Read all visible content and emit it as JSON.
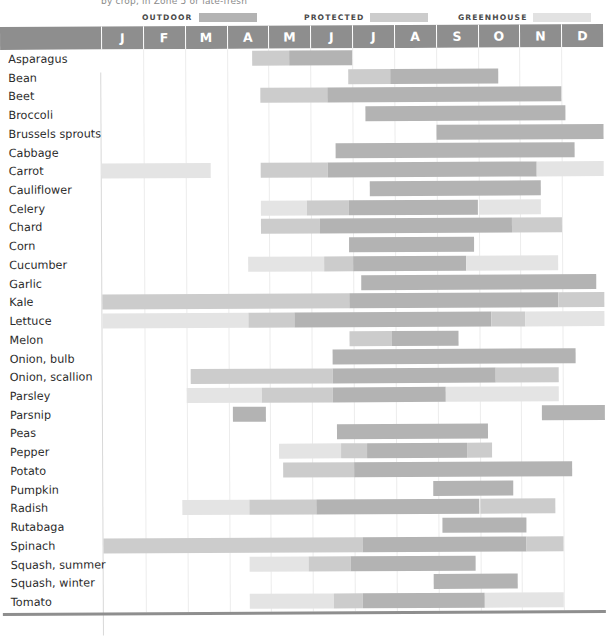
{
  "caption": "by crop, in Zone 5 or late-fresh",
  "legend": {
    "items": [
      {
        "label": "OUTDOOR",
        "color": "#b3b3b3",
        "key": "outdoor"
      },
      {
        "label": "PROTECTED",
        "color": "#cccccc",
        "key": "protected"
      },
      {
        "label": "GREENHOUSE",
        "color": "#e2e2e2",
        "key": "greenhouse"
      }
    ]
  },
  "colors": {
    "outdoor": "#b3b3b3",
    "protected": "#cccccc",
    "greenhouse": "#e4e4e4",
    "header_band": "#8e8e8e",
    "gridline": "#ececec",
    "text": "#2b2b2b"
  },
  "months": [
    "J",
    "F",
    "M",
    "A",
    "M",
    "J",
    "J",
    "A",
    "S",
    "O",
    "N",
    "D"
  ],
  "chart_data": {
    "type": "bar",
    "xlabel": "Month",
    "ylabel": "Crop",
    "grid": true,
    "legend_position": "top",
    "x": [
      "J",
      "F",
      "M",
      "A",
      "M",
      "J",
      "J",
      "A",
      "S",
      "O",
      "N",
      "D"
    ],
    "xlim": [
      0,
      12
    ],
    "categories": [
      "Asparagus",
      "Bean",
      "Beet",
      "Broccoli",
      "Brussels sprouts",
      "Cabbage",
      "Carrot",
      "Cauliflower",
      "Celery",
      "Chard",
      "Corn",
      "Cucumber",
      "Garlic",
      "Kale",
      "Lettuce",
      "Melon",
      "Onion, bulb",
      "Onion, scallion",
      "Parsley",
      "Parsnip",
      "Peas",
      "Pepper",
      "Potato",
      "Pumpkin",
      "Radish",
      "Rutabaga",
      "Spinach",
      "Squash, summer",
      "Squash, winter",
      "Tomato"
    ],
    "series": [
      {
        "name": "outdoor",
        "label": "OUTDOOR",
        "color": "#b3b3b3"
      },
      {
        "name": "protected",
        "label": "PROTECTED",
        "color": "#cccccc"
      },
      {
        "name": "greenhouse",
        "label": "GREENHOUSE",
        "color": "#e4e4e4"
      }
    ],
    "rows": [
      {
        "crop": "Asparagus",
        "bars": [
          {
            "type": "protected",
            "start": 3.6,
            "end": 4.5
          },
          {
            "type": "outdoor",
            "start": 4.5,
            "end": 6.0
          }
        ]
      },
      {
        "crop": "Bean",
        "bars": [
          {
            "type": "protected",
            "start": 5.9,
            "end": 6.9
          },
          {
            "type": "outdoor",
            "start": 6.9,
            "end": 9.5
          }
        ]
      },
      {
        "crop": "Beet",
        "bars": [
          {
            "type": "protected",
            "start": 3.8,
            "end": 5.4
          },
          {
            "type": "outdoor",
            "start": 5.4,
            "end": 11.0
          }
        ]
      },
      {
        "crop": "Broccoli",
        "bars": [
          {
            "type": "outdoor",
            "start": 6.3,
            "end": 11.1
          }
        ]
      },
      {
        "crop": "Brussels sprouts",
        "bars": [
          {
            "type": "outdoor",
            "start": 8.0,
            "end": 12.0
          }
        ]
      },
      {
        "crop": "Cabbage",
        "bars": [
          {
            "type": "outdoor",
            "start": 5.6,
            "end": 11.3
          }
        ]
      },
      {
        "crop": "Carrot",
        "bars": [
          {
            "type": "greenhouse",
            "start": 0.0,
            "end": 2.6
          },
          {
            "type": "protected",
            "start": 3.8,
            "end": 5.4
          },
          {
            "type": "outdoor",
            "start": 5.4,
            "end": 10.4
          },
          {
            "type": "greenhouse",
            "start": 10.4,
            "end": 12.0
          }
        ]
      },
      {
        "crop": "Cauliflower",
        "bars": [
          {
            "type": "outdoor",
            "start": 6.4,
            "end": 10.5
          }
        ]
      },
      {
        "crop": "Celery",
        "bars": [
          {
            "type": "greenhouse",
            "start": 3.8,
            "end": 4.9
          },
          {
            "type": "protected",
            "start": 4.9,
            "end": 5.9
          },
          {
            "type": "outdoor",
            "start": 5.9,
            "end": 9.0
          },
          {
            "type": "greenhouse",
            "start": 9.0,
            "end": 10.5
          }
        ]
      },
      {
        "crop": "Chard",
        "bars": [
          {
            "type": "protected",
            "start": 3.8,
            "end": 5.2
          },
          {
            "type": "outdoor",
            "start": 5.2,
            "end": 9.8
          },
          {
            "type": "protected",
            "start": 9.8,
            "end": 11.0
          }
        ]
      },
      {
        "crop": "Corn",
        "bars": [
          {
            "type": "outdoor",
            "start": 5.9,
            "end": 8.9
          }
        ]
      },
      {
        "crop": "Cucumber",
        "bars": [
          {
            "type": "greenhouse",
            "start": 3.5,
            "end": 5.3
          },
          {
            "type": "protected",
            "start": 5.3,
            "end": 6.0
          },
          {
            "type": "outdoor",
            "start": 6.0,
            "end": 8.7
          },
          {
            "type": "greenhouse",
            "start": 8.7,
            "end": 10.9
          }
        ]
      },
      {
        "crop": "Garlic",
        "bars": [
          {
            "type": "outdoor",
            "start": 6.2,
            "end": 11.8
          }
        ]
      },
      {
        "crop": "Kale",
        "bars": [
          {
            "type": "protected",
            "start": 0.0,
            "end": 5.9
          },
          {
            "type": "outdoor",
            "start": 5.9,
            "end": 10.9
          },
          {
            "type": "protected",
            "start": 10.9,
            "end": 12.0
          }
        ]
      },
      {
        "crop": "Lettuce",
        "bars": [
          {
            "type": "greenhouse",
            "start": 0.0,
            "end": 3.5
          },
          {
            "type": "protected",
            "start": 3.5,
            "end": 4.6
          },
          {
            "type": "outdoor",
            "start": 4.6,
            "end": 9.3
          },
          {
            "type": "protected",
            "start": 9.3,
            "end": 10.1
          },
          {
            "type": "greenhouse",
            "start": 10.1,
            "end": 12.0
          }
        ]
      },
      {
        "crop": "Melon",
        "bars": [
          {
            "type": "protected",
            "start": 5.9,
            "end": 6.9
          },
          {
            "type": "outdoor",
            "start": 6.9,
            "end": 8.5
          }
        ]
      },
      {
        "crop": "Onion, bulb",
        "bars": [
          {
            "type": "outdoor",
            "start": 5.5,
            "end": 11.3
          }
        ]
      },
      {
        "crop": "Onion, scallion",
        "bars": [
          {
            "type": "protected",
            "start": 2.1,
            "end": 5.5
          },
          {
            "type": "outdoor",
            "start": 5.5,
            "end": 9.4
          },
          {
            "type": "protected",
            "start": 9.4,
            "end": 10.9
          }
        ]
      },
      {
        "crop": "Parsley",
        "bars": [
          {
            "type": "greenhouse",
            "start": 2.0,
            "end": 3.8
          },
          {
            "type": "protected",
            "start": 3.8,
            "end": 5.5
          },
          {
            "type": "outdoor",
            "start": 5.5,
            "end": 8.2
          },
          {
            "type": "greenhouse",
            "start": 8.2,
            "end": 10.9
          }
        ]
      },
      {
        "crop": "Parsnip",
        "bars": [
          {
            "type": "outdoor",
            "start": 3.1,
            "end": 3.9
          },
          {
            "type": "outdoor",
            "start": 10.5,
            "end": 12.0
          }
        ]
      },
      {
        "crop": "Peas",
        "bars": [
          {
            "type": "outdoor",
            "start": 5.6,
            "end": 9.2
          }
        ]
      },
      {
        "crop": "Pepper",
        "bars": [
          {
            "type": "greenhouse",
            "start": 4.2,
            "end": 5.7
          },
          {
            "type": "protected",
            "start": 5.7,
            "end": 6.3
          },
          {
            "type": "outdoor",
            "start": 6.3,
            "end": 8.7
          },
          {
            "type": "protected",
            "start": 8.7,
            "end": 9.3
          }
        ]
      },
      {
        "crop": "Potato",
        "bars": [
          {
            "type": "protected",
            "start": 4.3,
            "end": 6.0
          },
          {
            "type": "outdoor",
            "start": 6.0,
            "end": 11.2
          }
        ]
      },
      {
        "crop": "Pumpkin",
        "bars": [
          {
            "type": "outdoor",
            "start": 7.9,
            "end": 9.8
          }
        ]
      },
      {
        "crop": "Radish",
        "bars": [
          {
            "type": "greenhouse",
            "start": 1.9,
            "end": 3.5
          },
          {
            "type": "protected",
            "start": 3.5,
            "end": 5.1
          },
          {
            "type": "outdoor",
            "start": 5.1,
            "end": 9.0
          },
          {
            "type": "protected",
            "start": 9.0,
            "end": 10.8
          }
        ]
      },
      {
        "crop": "Rutabaga",
        "bars": [
          {
            "type": "outdoor",
            "start": 8.1,
            "end": 10.1
          }
        ]
      },
      {
        "crop": "Spinach",
        "bars": [
          {
            "type": "protected",
            "start": 0.0,
            "end": 6.2
          },
          {
            "type": "outdoor",
            "start": 6.2,
            "end": 10.1
          },
          {
            "type": "protected",
            "start": 10.1,
            "end": 11.0
          }
        ]
      },
      {
        "crop": "Squash, summer",
        "bars": [
          {
            "type": "greenhouse",
            "start": 3.5,
            "end": 4.9
          },
          {
            "type": "protected",
            "start": 4.9,
            "end": 5.9
          },
          {
            "type": "outdoor",
            "start": 5.9,
            "end": 8.9
          }
        ]
      },
      {
        "crop": "Squash, winter",
        "bars": [
          {
            "type": "outdoor",
            "start": 7.9,
            "end": 9.9
          }
        ]
      },
      {
        "crop": "Tomato",
        "bars": [
          {
            "type": "greenhouse",
            "start": 3.5,
            "end": 5.5
          },
          {
            "type": "protected",
            "start": 5.5,
            "end": 6.2
          },
          {
            "type": "outdoor",
            "start": 6.2,
            "end": 9.1
          },
          {
            "type": "greenhouse",
            "start": 9.1,
            "end": 11.0
          }
        ]
      }
    ]
  },
  "layout": {
    "plot_left": 101,
    "plot_right": 603,
    "row_height": 18.73,
    "bar_height": 15
  }
}
